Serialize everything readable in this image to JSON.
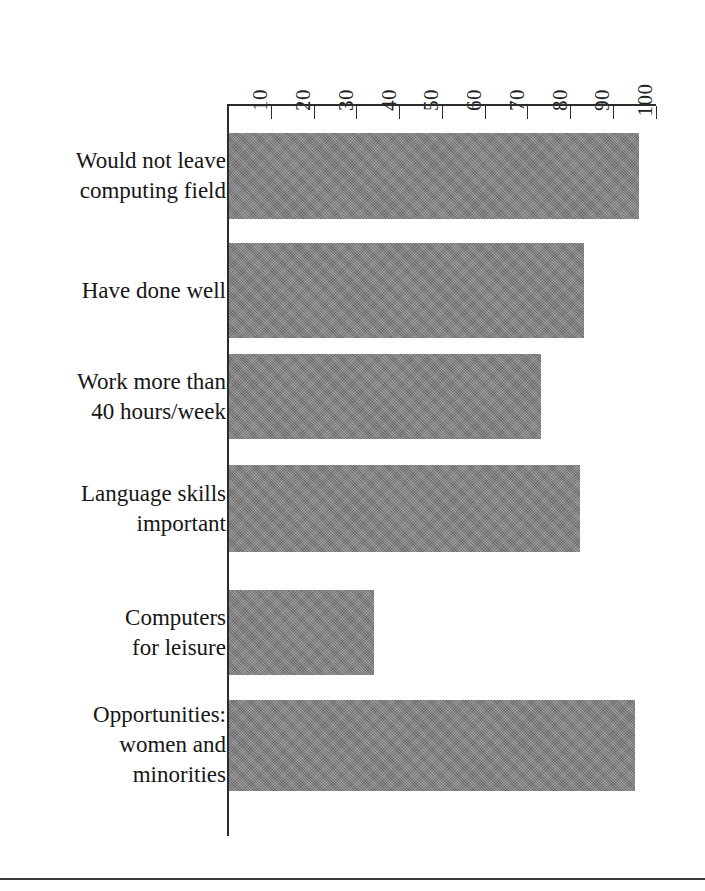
{
  "figure": {
    "kind": "horizontal-bar-chart",
    "bar_color": "#808080",
    "axis_color": "#2b2b2b"
  },
  "axis": {
    "tick_labels": [
      "10",
      "20",
      "30",
      "40",
      "50",
      "60",
      "70",
      "80",
      "90",
      "100"
    ],
    "orientation": "rotated-90"
  },
  "chart_data": {
    "type": "bar",
    "orientation": "horizontal",
    "title": "",
    "subtitle": "",
    "xlabel": "",
    "ylabel": "",
    "xlim": [
      0,
      100
    ],
    "grid": false,
    "legend": "none",
    "axis_position": "top",
    "tick_labels": [
      "10",
      "20",
      "30",
      "40",
      "50",
      "60",
      "70",
      "80",
      "90",
      "100"
    ],
    "tick_values": [
      10,
      20,
      30,
      40,
      50,
      60,
      70,
      80,
      90,
      100
    ],
    "categories": [
      "Would not leave\ncomputing field",
      "Have done well",
      "Work more than\n40 hours/week",
      "Language skills\nimportant",
      "Computers\nfor leisure",
      "Opportunities:\nwomen and\nminorities"
    ],
    "values": [
      96,
      83,
      73,
      82,
      34,
      95
    ],
    "series": [
      {
        "name": "",
        "values": [
          96,
          83,
          73,
          82,
          34,
          95
        ]
      }
    ]
  }
}
